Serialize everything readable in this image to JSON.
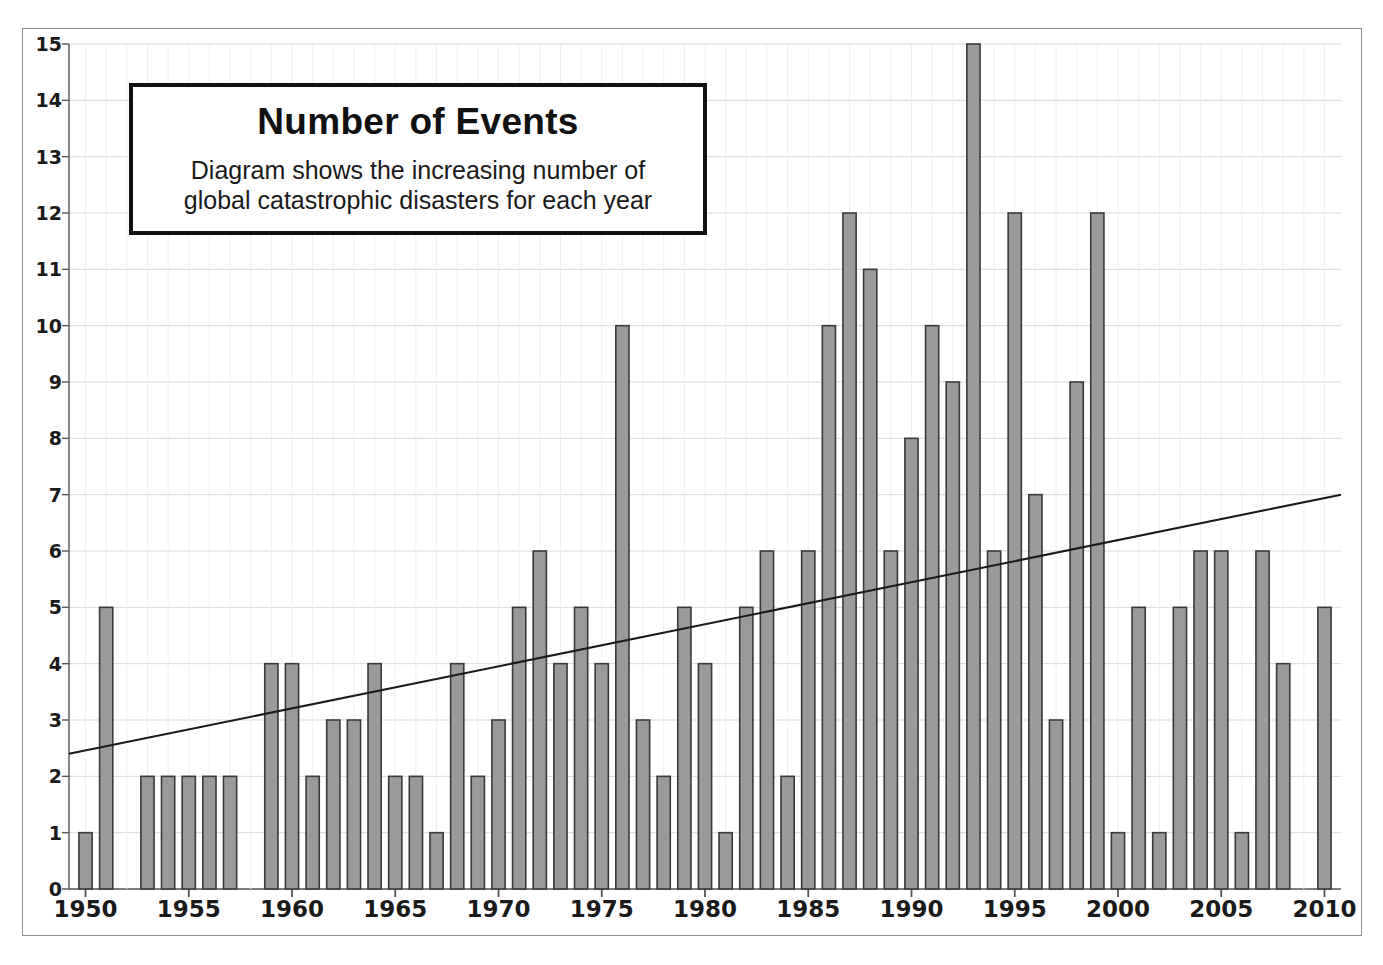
{
  "callout": {
    "title": "Number of Events",
    "subtitle_line_1": "Diagram shows the increasing number of",
    "subtitle_line_2": "global catastrophic disasters for each year"
  },
  "colors": {
    "bar_fill": "#9a9a9a",
    "bar_stroke": "#3a3a3a",
    "grid": "#d9d9d9",
    "axis": "#555555",
    "trend_line": "#1a1a1a",
    "frame": "#8c8c8c",
    "text": "#1a1a1a"
  },
  "chart_data": {
    "type": "bar",
    "title": "Number of Events",
    "subtitle": "Diagram shows the increasing number of global catastrophic disasters for each year",
    "xlabel": "",
    "ylabel": "",
    "xlim": [
      1949.2,
      2010.8
    ],
    "ylim": [
      0,
      15
    ],
    "grid": true,
    "legend": "none",
    "x_tick_labels": [
      "1950",
      "1955",
      "1960",
      "1965",
      "1970",
      "1975",
      "1980",
      "1985",
      "1990",
      "1995",
      "2000",
      "2005",
      "2010"
    ],
    "x_ticks": [
      1950,
      1955,
      1960,
      1965,
      1970,
      1975,
      1980,
      1985,
      1990,
      1995,
      2000,
      2005,
      2010
    ],
    "y_tick_labels": [
      "0",
      "1",
      "2",
      "3",
      "4",
      "5",
      "6",
      "7",
      "8",
      "9",
      "10",
      "11",
      "12",
      "13",
      "14",
      "15"
    ],
    "y_ticks": [
      0,
      1,
      2,
      3,
      4,
      5,
      6,
      7,
      8,
      9,
      10,
      11,
      12,
      13,
      14,
      15
    ],
    "categories": [
      1950,
      1951,
      1952,
      1953,
      1954,
      1955,
      1956,
      1957,
      1958,
      1959,
      1960,
      1961,
      1962,
      1963,
      1964,
      1965,
      1966,
      1967,
      1968,
      1969,
      1970,
      1971,
      1972,
      1973,
      1974,
      1975,
      1976,
      1977,
      1978,
      1979,
      1980,
      1981,
      1982,
      1983,
      1984,
      1985,
      1986,
      1987,
      1988,
      1989,
      1990,
      1991,
      1992,
      1993,
      1994,
      1995,
      1996,
      1997,
      1998,
      1999,
      2000,
      2001,
      2002,
      2003,
      2004,
      2005,
      2006,
      2007,
      2008,
      2009,
      2010
    ],
    "values": [
      1,
      5,
      0,
      2,
      2,
      2,
      2,
      2,
      0,
      4,
      4,
      2,
      3,
      3,
      4,
      2,
      2,
      1,
      4,
      2,
      3,
      5,
      6,
      4,
      5,
      4,
      10,
      3,
      2,
      5,
      4,
      1,
      5,
      6,
      2,
      6,
      10,
      12,
      11,
      6,
      8,
      10,
      9,
      15,
      6,
      12,
      7,
      3,
      9,
      12,
      1,
      5,
      1,
      5,
      6,
      6,
      1,
      6,
      4,
      0,
      5
    ],
    "series": [
      {
        "name": "Number of Events",
        "values": [
          1,
          5,
          0,
          2,
          2,
          2,
          2,
          2,
          0,
          4,
          4,
          2,
          3,
          3,
          4,
          2,
          2,
          1,
          4,
          2,
          3,
          5,
          6,
          4,
          5,
          4,
          10,
          3,
          2,
          5,
          4,
          1,
          5,
          6,
          2,
          6,
          10,
          12,
          11,
          6,
          8,
          10,
          9,
          15,
          6,
          12,
          7,
          3,
          9,
          12,
          1,
          5,
          1,
          5,
          6,
          6,
          1,
          6,
          4,
          0,
          5
        ]
      }
    ],
    "trend_line": {
      "name": "linear trend",
      "x_start": 1949.2,
      "y_start": 2.4,
      "x_end": 2010.8,
      "y_end": 7.0
    }
  }
}
